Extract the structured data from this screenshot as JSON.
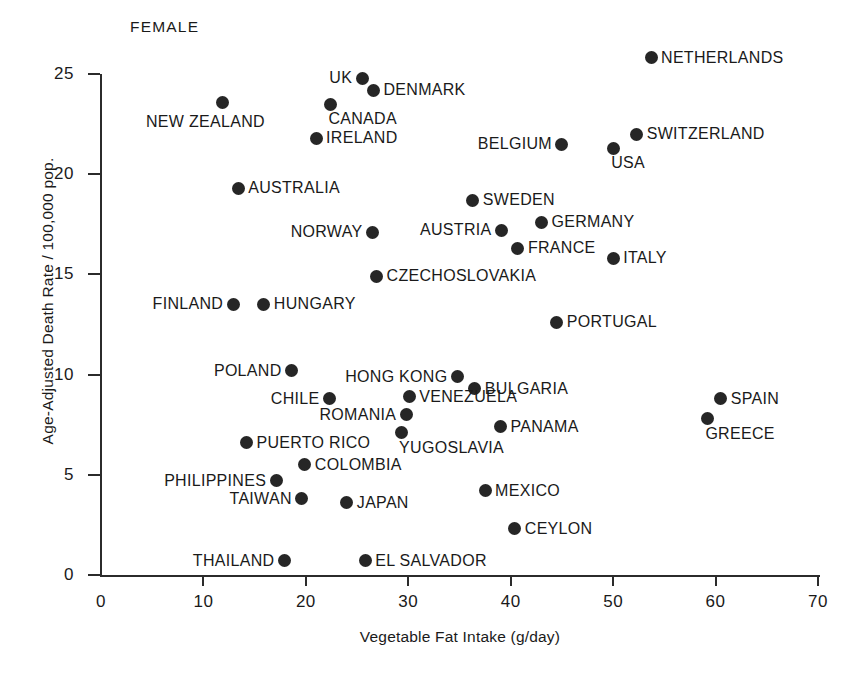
{
  "series_label": "FEMALE",
  "chart_data": {
    "type": "scatter",
    "title": "",
    "subtitle": "",
    "series_name": "FEMALE",
    "xlabel": "Vegetable Fat Intake (g/day)",
    "ylabel": "Age-Adjusted Death Rate / 100,000 pop.",
    "xlim": [
      0,
      70
    ],
    "ylim": [
      0,
      25
    ],
    "xticks": [
      0,
      10,
      20,
      30,
      40,
      50,
      60,
      70
    ],
    "yticks": [
      0,
      5,
      10,
      15,
      20,
      25
    ],
    "grid": false,
    "legend": "none",
    "marker_color": "#262626",
    "axis_color": "#2b2b2b",
    "points": [
      {
        "label": "NETHERLANDS",
        "x": 53.7,
        "y": 25.8,
        "side": "right"
      },
      {
        "label": "UK",
        "x": 25.5,
        "y": 24.8,
        "side": "left"
      },
      {
        "label": "DENMARK",
        "x": 26.6,
        "y": 24.2,
        "side": "right"
      },
      {
        "label": "NEW ZEALAND",
        "x": 11.9,
        "y": 23.6,
        "side": "below-left"
      },
      {
        "label": "CANADA",
        "x": 22.4,
        "y": 23.5,
        "side": "below-right"
      },
      {
        "label": "SWITZERLAND",
        "x": 52.3,
        "y": 22.0,
        "side": "right"
      },
      {
        "label": "IRELAND",
        "x": 21.0,
        "y": 21.8,
        "side": "right"
      },
      {
        "label": "BELGIUM",
        "x": 45.0,
        "y": 21.5,
        "side": "left"
      },
      {
        "label": "USA",
        "x": 50.0,
        "y": 21.3,
        "side": "below-right"
      },
      {
        "label": "AUSTRALIA",
        "x": 13.4,
        "y": 19.3,
        "side": "right"
      },
      {
        "label": "SWEDEN",
        "x": 36.3,
        "y": 18.7,
        "side": "right"
      },
      {
        "label": "GERMANY",
        "x": 43.0,
        "y": 17.6,
        "side": "right"
      },
      {
        "label": "AUSTRIA",
        "x": 39.1,
        "y": 17.2,
        "side": "left"
      },
      {
        "label": "NORWAY",
        "x": 26.5,
        "y": 17.1,
        "side": "left"
      },
      {
        "label": "FRANCE",
        "x": 40.7,
        "y": 16.3,
        "side": "right"
      },
      {
        "label": "ITALY",
        "x": 50.0,
        "y": 15.8,
        "side": "right"
      },
      {
        "label": "CZECHOSLOVAKIA",
        "x": 26.9,
        "y": 14.9,
        "side": "right"
      },
      {
        "label": "FINLAND",
        "x": 12.9,
        "y": 13.5,
        "side": "left"
      },
      {
        "label": "HUNGARY",
        "x": 15.9,
        "y": 13.5,
        "side": "right"
      },
      {
        "label": "PORTUGAL",
        "x": 44.5,
        "y": 12.6,
        "side": "right"
      },
      {
        "label": "POLAND",
        "x": 18.6,
        "y": 10.2,
        "side": "left"
      },
      {
        "label": "HONG KONG",
        "x": 34.8,
        "y": 9.9,
        "side": "left"
      },
      {
        "label": "BULGARIA",
        "x": 36.5,
        "y": 9.3,
        "side": "right"
      },
      {
        "label": "VENEZUELA",
        "x": 30.1,
        "y": 8.9,
        "side": "right"
      },
      {
        "label": "CHILE",
        "x": 22.3,
        "y": 8.8,
        "side": "left"
      },
      {
        "label": "SPAIN",
        "x": 60.5,
        "y": 8.8,
        "side": "right"
      },
      {
        "label": "ROMANIA",
        "x": 29.8,
        "y": 8.0,
        "side": "left"
      },
      {
        "label": "GREECE",
        "x": 59.2,
        "y": 7.8,
        "side": "below-right"
      },
      {
        "label": "PANAMA",
        "x": 39.0,
        "y": 7.4,
        "side": "right"
      },
      {
        "label": "YUGOSLAVIA",
        "x": 29.3,
        "y": 7.1,
        "side": "below-right"
      },
      {
        "label": "PUERTO RICO",
        "x": 14.2,
        "y": 6.6,
        "side": "right"
      },
      {
        "label": "COLOMBIA",
        "x": 19.9,
        "y": 5.5,
        "side": "right"
      },
      {
        "label": "PHILIPPINES",
        "x": 17.1,
        "y": 4.7,
        "side": "left"
      },
      {
        "label": "MEXICO",
        "x": 37.5,
        "y": 4.2,
        "side": "right"
      },
      {
        "label": "TAIWAN",
        "x": 19.6,
        "y": 3.8,
        "side": "left"
      },
      {
        "label": "JAPAN",
        "x": 24.0,
        "y": 3.6,
        "side": "right"
      },
      {
        "label": "CEYLON",
        "x": 40.4,
        "y": 2.3,
        "side": "right"
      },
      {
        "label": "THAILAND",
        "x": 17.9,
        "y": 0.7,
        "side": "left"
      },
      {
        "label": "EL SALVADOR",
        "x": 25.8,
        "y": 0.7,
        "side": "right"
      }
    ]
  }
}
